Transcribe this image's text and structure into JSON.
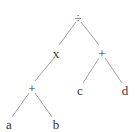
{
  "diagram": {
    "type": "expression-tree",
    "nodes": {
      "root": {
        "label": "÷",
        "x": 78,
        "y": 18
      },
      "times": {
        "label": "x",
        "x": 56,
        "y": 55
      },
      "plus_right": {
        "label": "+",
        "x": 102,
        "y": 54
      },
      "plus_left": {
        "label": "+",
        "x": 32,
        "y": 89
      },
      "c": {
        "label": "c",
        "x": 80,
        "y": 92
      },
      "d": {
        "label": "d",
        "x": 125,
        "y": 92
      },
      "a": {
        "label": "a",
        "x": 9,
        "y": 127
      },
      "b": {
        "label": "b",
        "x": 56,
        "y": 127
      }
    },
    "edges": [
      [
        "root",
        "times"
      ],
      [
        "root",
        "plus_right"
      ],
      [
        "times",
        "plus_left"
      ],
      [
        "plus_right",
        "c"
      ],
      [
        "plus_right",
        "d"
      ],
      [
        "plus_left",
        "a"
      ],
      [
        "plus_left",
        "b"
      ]
    ]
  }
}
